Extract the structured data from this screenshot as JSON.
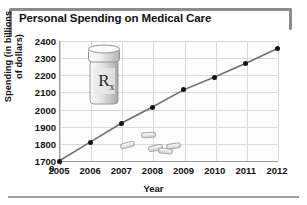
{
  "figure": {
    "title": "Personal Spending on Medical Care",
    "frame_color": "#8c8c8c"
  },
  "chart_data": {
    "type": "line",
    "title": "Personal Spending on Medical Care",
    "xlabel": "Year",
    "ylabel": "Spending (in billions of dollars)",
    "ylabel_line1": "Spending (in billions",
    "ylabel_line2": "of dollars)",
    "categories": [
      "2005",
      "2006",
      "2007",
      "2008",
      "2009",
      "2010",
      "2011",
      "2012"
    ],
    "x": [
      2005,
      2006,
      2007,
      2008,
      2009,
      2010,
      2011,
      2012
    ],
    "values": [
      1700,
      1810,
      1920,
      2015,
      2115,
      2190,
      2270,
      2355
    ],
    "series": [
      {
        "name": "Personal spending on medical care",
        "values": [
          1700,
          1810,
          1920,
          2015,
          2115,
          2190,
          2270,
          2355
        ]
      }
    ],
    "yticks": [
      1700,
      1800,
      1900,
      2000,
      2100,
      2200,
      2300,
      2400
    ],
    "ytick_labels": [
      "1700",
      "1800",
      "1900",
      "2000",
      "2100",
      "2200",
      "2300",
      "2400"
    ],
    "xtick_labels": [
      "2005",
      "2006",
      "2007",
      "2008",
      "2009",
      "2010",
      "2011",
      "2012"
    ],
    "ylim": [
      1700,
      2400
    ],
    "xlim": [
      2005,
      2012
    ],
    "axis_break": true,
    "zero_label": "0",
    "grid": true,
    "legend": "none",
    "marker": "filled-circle",
    "line_color": "#6f6f6f",
    "marker_color": "#141414",
    "grid_color": "#d8d8dc"
  },
  "decorations": {
    "bottle_label": "R",
    "bottle_label_sub": "x",
    "pill_count": 5
  }
}
